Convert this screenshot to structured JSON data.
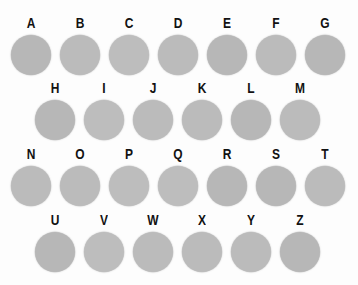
{
  "board": {
    "title": "Labeled Circle Grid",
    "background_color": "#fdfdfd",
    "disc_color": "#b9b9b9",
    "label_color": "#121212",
    "disc_diameter_px": 40,
    "column_pitch_px": 49,
    "row_pitch_px": 65,
    "rows": [
      {
        "name": "row-1",
        "top_px": 14,
        "left_px": 10,
        "count": 7,
        "cells": [
          {
            "label": "A",
            "tone": "t1"
          },
          {
            "label": "B",
            "tone": "t2"
          },
          {
            "label": "C",
            "tone": "t3"
          },
          {
            "label": "D",
            "tone": "t2"
          },
          {
            "label": "E",
            "tone": "t1"
          },
          {
            "label": "F",
            "tone": "t2"
          },
          {
            "label": "G",
            "tone": "t1"
          }
        ]
      },
      {
        "name": "row-2",
        "top_px": 79,
        "left_px": 34,
        "count": 6,
        "cells": [
          {
            "label": "H",
            "tone": "t1"
          },
          {
            "label": "I",
            "tone": "t3"
          },
          {
            "label": "J",
            "tone": "t2"
          },
          {
            "label": "K",
            "tone": "t2"
          },
          {
            "label": "L",
            "tone": "t1"
          },
          {
            "label": "M",
            "tone": "t2"
          }
        ]
      },
      {
        "name": "row-3",
        "top_px": 145,
        "left_px": 10,
        "count": 7,
        "cells": [
          {
            "label": "N",
            "tone": "t2"
          },
          {
            "label": "O",
            "tone": "t2"
          },
          {
            "label": "P",
            "tone": "t3"
          },
          {
            "label": "Q",
            "tone": "t3"
          },
          {
            "label": "R",
            "tone": "t1"
          },
          {
            "label": "S",
            "tone": "t1"
          },
          {
            "label": "T",
            "tone": "t2"
          }
        ]
      },
      {
        "name": "row-4",
        "top_px": 211,
        "left_px": 34,
        "count": 6,
        "cells": [
          {
            "label": "U",
            "tone": "t1"
          },
          {
            "label": "V",
            "tone": "t3"
          },
          {
            "label": "W",
            "tone": "t2"
          },
          {
            "label": "X",
            "tone": "t2"
          },
          {
            "label": "Y",
            "tone": "t2"
          },
          {
            "label": "Z",
            "tone": "t1"
          }
        ]
      }
    ]
  }
}
